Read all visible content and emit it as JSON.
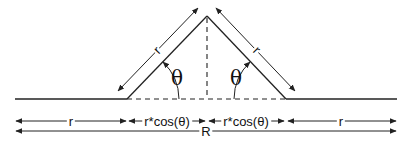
{
  "figure": {
    "colors": {
      "line": "#222222",
      "background": "#ffffff"
    }
  },
  "labels": {
    "left_diagonal": "r",
    "right_diagonal": "r",
    "left_angle": "θ",
    "right_angle": "θ",
    "row1": [
      "r",
      "r*cos(θ)",
      "r*cos(θ)",
      "r"
    ],
    "row2_total": "R"
  },
  "geometry": {
    "baseline_y": 99,
    "baseline_x": [
      15,
      397
    ],
    "apex": [
      207,
      16
    ],
    "left_foot": [
      127,
      99
    ],
    "right_foot": [
      286,
      99
    ],
    "dimension_row_y": [
      121,
      131
    ]
  }
}
